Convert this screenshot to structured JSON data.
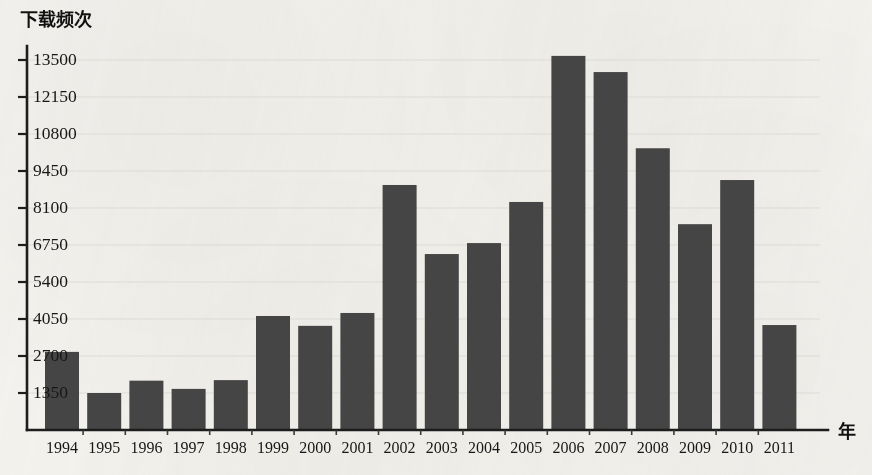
{
  "chart_data": {
    "type": "bar",
    "title": "",
    "ylabel": "下载频次",
    "xlabel": "年",
    "categories": [
      "1994",
      "1995",
      "1996",
      "1997",
      "1998",
      "1999",
      "2000",
      "2001",
      "2002",
      "2003",
      "2004",
      "2005",
      "2006",
      "2007",
      "2008",
      "2009",
      "2010",
      "2011"
    ],
    "values": [
      2850,
      1350,
      1800,
      1500,
      1820,
      4160,
      3800,
      4270,
      8940,
      6420,
      6820,
      8320,
      13650,
      13060,
      10280,
      7510,
      9120,
      3830
    ],
    "ylim": [
      0,
      14200
    ],
    "yticks": [
      1350,
      2700,
      4050,
      5400,
      6750,
      8100,
      9450,
      10800,
      12150,
      13500
    ],
    "ytick_labels": [
      "1350",
      "2700",
      "4050",
      "5400",
      "6750",
      "8100",
      "9450",
      "10800",
      "12150",
      "13500"
    ],
    "grid": true,
    "legend": null,
    "bar_color": "#454545",
    "axis_color": "#1d1d1d",
    "background_color": "#f3f2ee"
  }
}
